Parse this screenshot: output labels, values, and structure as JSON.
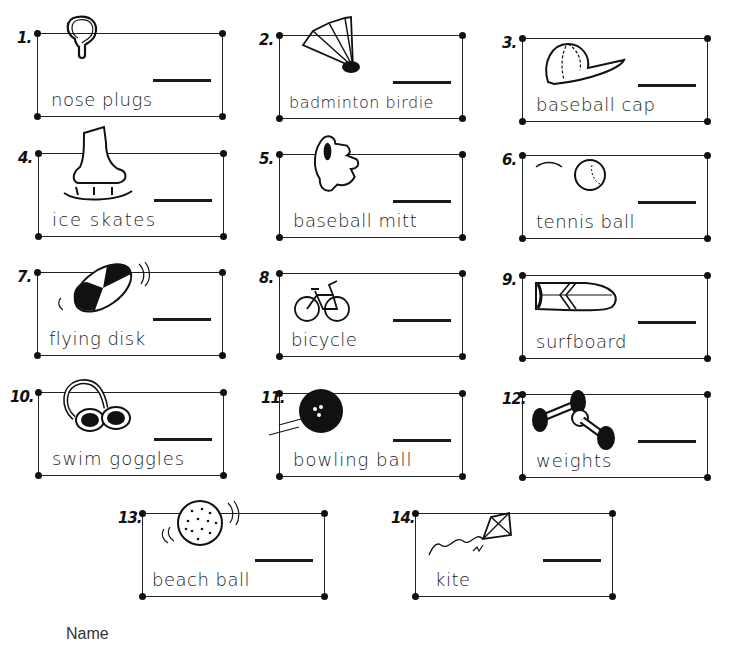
{
  "worksheet": {
    "items": [
      {
        "number": "1.",
        "label": "nose plugs",
        "icon": "nose-plugs-icon"
      },
      {
        "number": "2.",
        "label": "badminton birdie",
        "icon": "birdie-icon"
      },
      {
        "number": "3.",
        "label": "baseball cap",
        "icon": "baseball-cap-icon"
      },
      {
        "number": "4.",
        "label": "ice skates",
        "icon": "ice-skate-icon"
      },
      {
        "number": "5.",
        "label": "baseball mitt",
        "icon": "baseball-mitt-icon"
      },
      {
        "number": "6.",
        "label": "tennis ball",
        "icon": "tennis-ball-icon"
      },
      {
        "number": "7.",
        "label": "flying disk",
        "icon": "flying-disk-icon"
      },
      {
        "number": "8.",
        "label": "bicycle",
        "icon": "bicycle-icon"
      },
      {
        "number": "9.",
        "label": "surfboard",
        "icon": "surfboard-icon"
      },
      {
        "number": "10.",
        "label": "swim goggles",
        "icon": "swim-goggles-icon"
      },
      {
        "number": "11.",
        "label": "bowling ball",
        "icon": "bowling-ball-icon"
      },
      {
        "number": "12.",
        "label": "weights",
        "icon": "weights-icon"
      },
      {
        "number": "13.",
        "label": "beach ball",
        "icon": "beach-ball-icon"
      },
      {
        "number": "14.",
        "label": "kite",
        "icon": "kite-icon"
      }
    ],
    "footer": {
      "name_label": "Name"
    }
  }
}
